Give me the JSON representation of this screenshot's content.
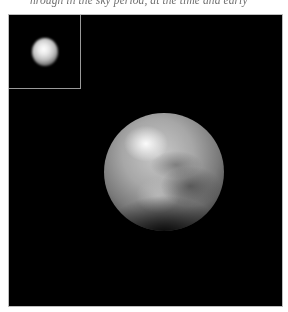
{
  "page": {
    "top_text_fragment": "hrough in the sky period, at the time and early"
  },
  "figure": {
    "background_color": "#000000",
    "inset": {
      "label": "small-scale view",
      "border_color": "#9a9a9a",
      "subject": "blurry bright dot"
    },
    "main_subject": "planetary body (mottled bright and dark regions)"
  }
}
